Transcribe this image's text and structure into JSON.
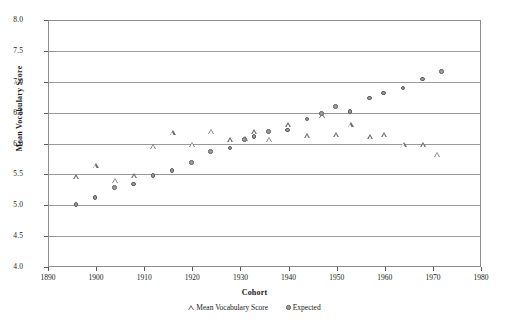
{
  "chart_data": {
    "type": "scatter",
    "title": "",
    "xlabel": "Cohort",
    "ylabel": "Mean Vocabulary Score",
    "xlim": [
      1890,
      1980
    ],
    "ylim": [
      4.0,
      8.0
    ],
    "xticks": [
      1890,
      1900,
      1910,
      1920,
      1930,
      1940,
      1950,
      1960,
      1970,
      1980
    ],
    "yticks": [
      4.0,
      4.5,
      5.0,
      5.5,
      6.0,
      6.5,
      7.0,
      7.5,
      8.0
    ],
    "xtick_labels": [
      "1890",
      "1900",
      "1910",
      "1920",
      "1930",
      "1940",
      "1950",
      "1960",
      "1970",
      "1980"
    ],
    "ytick_labels": [
      "4.0",
      "4.5",
      "5.0",
      "5.5",
      "6.0",
      "6.5",
      "7.0",
      "7.5",
      "8.0"
    ],
    "grid": "horizontal",
    "legend_position": "bottom",
    "series": [
      {
        "name": "Mean Vocabulary Score",
        "marker": "open-triangle",
        "color": "#6e6e6e",
        "points": [
          {
            "x": 1896,
            "y": 5.45
          },
          {
            "x": 1900,
            "y": 5.63
          },
          {
            "x": 1904,
            "y": 5.4
          },
          {
            "x": 1908,
            "y": 5.47
          },
          {
            "x": 1912,
            "y": 5.95
          },
          {
            "x": 1916,
            "y": 6.17
          },
          {
            "x": 1920,
            "y": 5.98
          },
          {
            "x": 1924,
            "y": 6.19
          },
          {
            "x": 1928,
            "y": 6.05
          },
          {
            "x": 1931,
            "y": 6.08
          },
          {
            "x": 1933,
            "y": 6.18
          },
          {
            "x": 1936,
            "y": 6.06
          },
          {
            "x": 1940,
            "y": 6.3
          },
          {
            "x": 1944,
            "y": 6.12
          },
          {
            "x": 1947,
            "y": 6.45
          },
          {
            "x": 1950,
            "y": 6.13
          },
          {
            "x": 1953,
            "y": 6.3
          },
          {
            "x": 1957,
            "y": 6.1
          },
          {
            "x": 1960,
            "y": 6.13
          },
          {
            "x": 1964,
            "y": 5.98
          },
          {
            "x": 1968,
            "y": 5.97
          },
          {
            "x": 1971,
            "y": 5.82
          }
        ]
      },
      {
        "name": "Expected",
        "marker": "filled-circle",
        "color": "#9d9d9d",
        "points": [
          {
            "x": 1896,
            "y": 5.0
          },
          {
            "x": 1900,
            "y": 5.11
          },
          {
            "x": 1904,
            "y": 5.27
          },
          {
            "x": 1908,
            "y": 5.33
          },
          {
            "x": 1912,
            "y": 5.47
          },
          {
            "x": 1916,
            "y": 5.55
          },
          {
            "x": 1920,
            "y": 5.68
          },
          {
            "x": 1924,
            "y": 5.85
          },
          {
            "x": 1928,
            "y": 5.91
          },
          {
            "x": 1931,
            "y": 6.05
          },
          {
            "x": 1933,
            "y": 6.1
          },
          {
            "x": 1936,
            "y": 6.18
          },
          {
            "x": 1940,
            "y": 6.2
          },
          {
            "x": 1944,
            "y": 6.38
          },
          {
            "x": 1947,
            "y": 6.47
          },
          {
            "x": 1950,
            "y": 6.58
          },
          {
            "x": 1953,
            "y": 6.5
          },
          {
            "x": 1957,
            "y": 6.72
          },
          {
            "x": 1960,
            "y": 6.8
          },
          {
            "x": 1964,
            "y": 6.88
          },
          {
            "x": 1968,
            "y": 7.03
          },
          {
            "x": 1972,
            "y": 7.15
          }
        ]
      }
    ]
  }
}
